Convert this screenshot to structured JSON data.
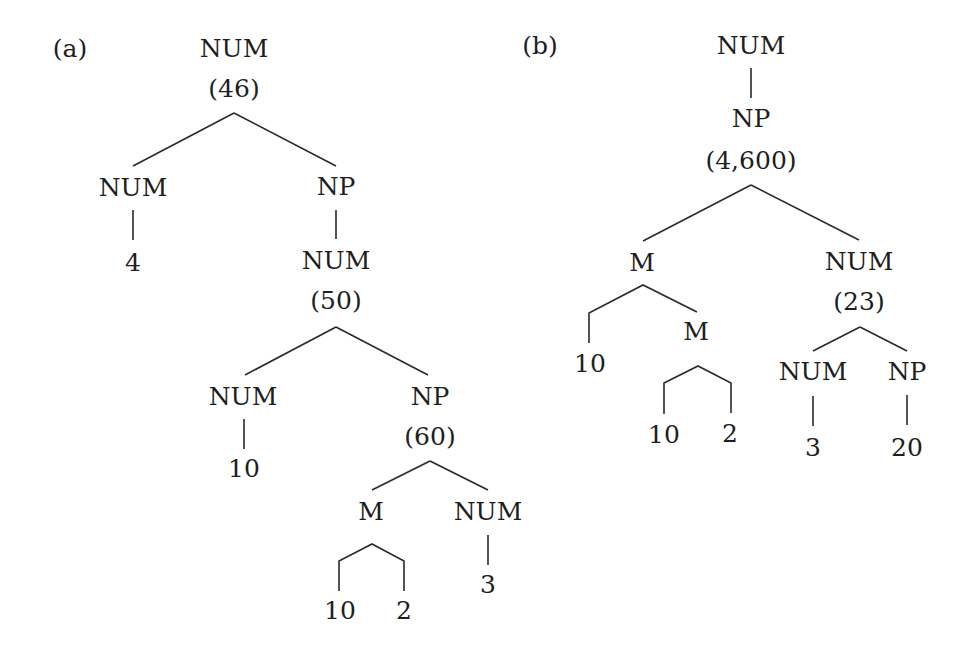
{
  "figure": {
    "panels": [
      {
        "id": "a",
        "label": "(a)",
        "label_pos": [
          70,
          48
        ],
        "nodes": [
          {
            "id": "a0",
            "text": "NUM",
            "x": 234,
            "y": 48
          },
          {
            "id": "a0v",
            "text": "(46)",
            "x": 234,
            "y": 88
          },
          {
            "id": "a1",
            "text": "NUM",
            "x": 133,
            "y": 187
          },
          {
            "id": "a2",
            "text": "4",
            "x": 133,
            "y": 262
          },
          {
            "id": "a3",
            "text": "NP",
            "x": 336,
            "y": 186
          },
          {
            "id": "a4",
            "text": "NUM",
            "x": 336,
            "y": 260
          },
          {
            "id": "a4v",
            "text": "(50)",
            "x": 336,
            "y": 300
          },
          {
            "id": "a5",
            "text": "NUM",
            "x": 243,
            "y": 396
          },
          {
            "id": "a6",
            "text": "10",
            "x": 244,
            "y": 468
          },
          {
            "id": "a7",
            "text": "NP",
            "x": 430,
            "y": 396
          },
          {
            "id": "a7v",
            "text": "(60)",
            "x": 430,
            "y": 436
          },
          {
            "id": "a8",
            "text": "M",
            "x": 371,
            "y": 511
          },
          {
            "id": "a9",
            "text": "NUM",
            "x": 488,
            "y": 511
          },
          {
            "id": "a10",
            "text": "10",
            "x": 340,
            "y": 610
          },
          {
            "id": "a11",
            "text": "2",
            "x": 404,
            "y": 610
          },
          {
            "id": "a12",
            "text": "3",
            "x": 488,
            "y": 584
          }
        ],
        "edges": [
          {
            "type": "line",
            "points": [
              [
                234,
                113
              ],
              [
                133,
                166
              ]
            ]
          },
          {
            "type": "line",
            "points": [
              [
                234,
                113
              ],
              [
                336,
                166
              ]
            ]
          },
          {
            "type": "line",
            "points": [
              [
                133,
                210
              ],
              [
                133,
                240
              ]
            ]
          },
          {
            "type": "line",
            "points": [
              [
                336,
                210
              ],
              [
                336,
                239
              ]
            ]
          },
          {
            "type": "line",
            "points": [
              [
                336,
                327
              ],
              [
                245,
                375
              ]
            ]
          },
          {
            "type": "line",
            "points": [
              [
                336,
                327
              ],
              [
                428,
                375
              ]
            ]
          },
          {
            "type": "line",
            "points": [
              [
                244,
                419
              ],
              [
                244,
                449
              ]
            ]
          },
          {
            "type": "line",
            "points": [
              [
                430,
                461
              ],
              [
                372,
                490
              ]
            ]
          },
          {
            "type": "line",
            "points": [
              [
                430,
                461
              ],
              [
                488,
                490
              ]
            ]
          },
          {
            "type": "polyline",
            "points": [
              [
                339,
                591
              ],
              [
                339,
                561
              ],
              [
                372,
                544
              ],
              [
                404,
                561
              ],
              [
                404,
                591
              ]
            ]
          },
          {
            "type": "line",
            "points": [
              [
                488,
                535
              ],
              [
                488,
                565
              ]
            ]
          }
        ]
      },
      {
        "id": "b",
        "label": "(b)",
        "label_pos": [
          540,
          45
        ],
        "nodes": [
          {
            "id": "b0",
            "text": "NUM",
            "x": 751,
            "y": 45
          },
          {
            "id": "b1",
            "text": "NP",
            "x": 751,
            "y": 118
          },
          {
            "id": "b1v",
            "text": "(4,600)",
            "x": 751,
            "y": 160
          },
          {
            "id": "b2",
            "text": "M",
            "x": 642,
            "y": 262
          },
          {
            "id": "b3",
            "text": "10",
            "x": 590,
            "y": 363
          },
          {
            "id": "b4",
            "text": "M",
            "x": 696,
            "y": 331
          },
          {
            "id": "b5",
            "text": "10",
            "x": 664,
            "y": 434
          },
          {
            "id": "b6",
            "text": "2",
            "x": 730,
            "y": 433
          },
          {
            "id": "b7",
            "text": "NUM",
            "x": 859,
            "y": 261
          },
          {
            "id": "b7v",
            "text": "(23)",
            "x": 859,
            "y": 301
          },
          {
            "id": "b8",
            "text": "NUM",
            "x": 813,
            "y": 371
          },
          {
            "id": "b9",
            "text": "NP",
            "x": 907,
            "y": 371
          },
          {
            "id": "b10",
            "text": "3",
            "x": 813,
            "y": 447
          },
          {
            "id": "b11",
            "text": "20",
            "x": 907,
            "y": 447
          }
        ],
        "edges": [
          {
            "type": "line",
            "points": [
              [
                751,
                68
              ],
              [
                751,
                98
              ]
            ]
          },
          {
            "type": "line",
            "points": [
              [
                751,
                185
              ],
              [
                643,
                241
              ]
            ]
          },
          {
            "type": "line",
            "points": [
              [
                751,
                185
              ],
              [
                859,
                240
              ]
            ]
          },
          {
            "type": "polyline",
            "points": [
              [
                589,
                343
              ],
              [
                589,
                313
              ],
              [
                643,
                285
              ],
              [
                697,
                312
              ]
            ]
          },
          {
            "type": "polyline",
            "points": [
              [
                664,
                414
              ],
              [
                664,
                383
              ],
              [
                698,
                366
              ],
              [
                731,
                383
              ],
              [
                731,
                413
              ]
            ]
          },
          {
            "type": "line",
            "points": [
              [
                860,
                327
              ],
              [
                813,
                351
              ]
            ]
          },
          {
            "type": "line",
            "points": [
              [
                860,
                327
              ],
              [
                907,
                351
              ]
            ]
          },
          {
            "type": "line",
            "points": [
              [
                813,
                396
              ],
              [
                813,
                426
              ]
            ]
          },
          {
            "type": "line",
            "points": [
              [
                907,
                395
              ],
              [
                907,
                425
              ]
            ]
          }
        ]
      }
    ]
  }
}
